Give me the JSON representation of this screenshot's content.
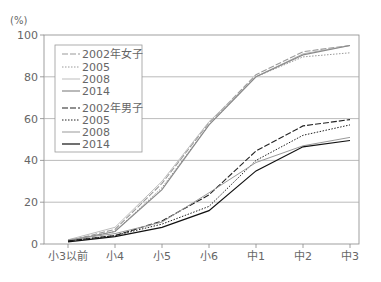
{
  "chart_data": {
    "type": "line",
    "title": "",
    "xlabel": "",
    "ylabel": "(%)",
    "ylim": [
      0,
      100
    ],
    "yticks": [
      0,
      20,
      40,
      60,
      80,
      100
    ],
    "grid": true,
    "legend_position": "upper-left-inside",
    "categories": [
      "小3以前",
      "小4",
      "小5",
      "小6",
      "中1",
      "中2",
      "中3"
    ],
    "series": [
      {
        "name": "2002年女子",
        "group": "female",
        "style": "dashed",
        "color": "#9a9a9a",
        "values": [
          1.5,
          7,
          29,
          58,
          81,
          92,
          95
        ]
      },
      {
        "name": "2005",
        "group": "female",
        "style": "dotted",
        "color": "#9a9a9a",
        "values": [
          1.5,
          6,
          27,
          57,
          80,
          89.5,
          91.5
        ]
      },
      {
        "name": "2008",
        "group": "female",
        "style": "solid-light",
        "color": "#bdbdbd",
        "values": [
          2,
          8,
          30,
          58.5,
          80,
          91,
          95
        ]
      },
      {
        "name": "2014",
        "group": "female",
        "style": "solid",
        "color": "#8a8a8a",
        "values": [
          1.5,
          6,
          26,
          57,
          80,
          90.5,
          95
        ]
      },
      {
        "name": "2002年男子",
        "group": "male",
        "style": "dashed",
        "color": "#222222",
        "values": [
          1.5,
          4,
          11,
          23.5,
          44.5,
          56.5,
          59.5
        ]
      },
      {
        "name": "2005",
        "group": "male",
        "style": "dotted",
        "color": "#222222",
        "values": [
          1.5,
          4,
          9.5,
          18,
          40,
          52,
          57
        ]
      },
      {
        "name": "2008",
        "group": "male",
        "style": "solid-light",
        "color": "#999999",
        "values": [
          2,
          5,
          10.5,
          24.5,
          39,
          47,
          51
        ]
      },
      {
        "name": "2014",
        "group": "male",
        "style": "solid",
        "color": "#111111",
        "values": [
          1,
          3.5,
          8,
          16,
          35,
          46.5,
          49.5
        ]
      }
    ]
  },
  "axis": {
    "unit_label": "(%)",
    "y_labels": [
      "0",
      "20",
      "40",
      "60",
      "80",
      "100"
    ],
    "x_labels": [
      "小3以前",
      "小4",
      "小5",
      "小6",
      "中1",
      "中2",
      "中3"
    ]
  },
  "legend": {
    "items": [
      "2002年女子",
      "2005",
      "2008",
      "2014",
      "2002年男子",
      "2005",
      "2008",
      "2014"
    ]
  }
}
